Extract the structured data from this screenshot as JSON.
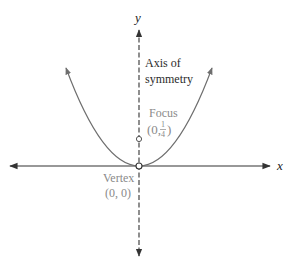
{
  "diagram": {
    "axes": {
      "x_label": "x",
      "y_label": "y"
    },
    "axis_of_symmetry": {
      "line1": "Axis of",
      "line2": "symmetry"
    },
    "focus": {
      "label": "Focus",
      "coord_open": "(0,",
      "coord_num": "1",
      "coord_den": "4",
      "coord_close": ")"
    },
    "vertex": {
      "label": "Vertex",
      "coord": "(0, 0)"
    },
    "colors": {
      "axis": "#333333",
      "curve": "#6e6e6e",
      "label_dark": "#2b2b2b",
      "label_gray": "#8a8a8a"
    }
  }
}
